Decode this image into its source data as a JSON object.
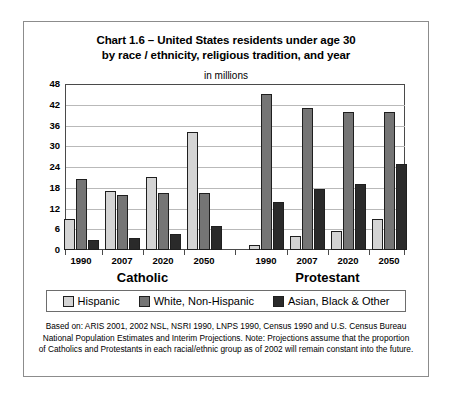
{
  "chart_data": {
    "type": "bar",
    "title": "Chart 1.6 – United States residents under age 30 by race / ethnicity, religious tradition, and year",
    "title_lines": [
      "Chart 1.6 – United States residents under age 30",
      "by race / ethnicity, religious tradition, and year"
    ],
    "subtitle": "in millions",
    "xlabel": "",
    "ylabel": "",
    "ylim": [
      0,
      48
    ],
    "yticks": [
      48,
      42,
      36,
      30,
      24,
      18,
      12,
      6,
      0
    ],
    "grid": true,
    "legend_position": "bottom",
    "groups": [
      "Catholic",
      "Protestant"
    ],
    "categories": [
      "1990",
      "2007",
      "2020",
      "2050",
      "1990",
      "2007",
      "2020",
      "2050"
    ],
    "series": [
      {
        "name": "Hispanic",
        "color": "#d4d4d4",
        "values": [
          9,
          17,
          21,
          34,
          1.5,
          4,
          5.5,
          9
        ]
      },
      {
        "name": "White, Non-Hispanic",
        "color": "#757575",
        "values": [
          20.5,
          16,
          16.5,
          16.5,
          45,
          41,
          40,
          40
        ]
      },
      {
        "name": "Asian, Black & Other",
        "color": "#2a2a2a",
        "values": [
          3,
          3.5,
          4.5,
          7,
          14,
          17.5,
          19,
          25
        ]
      }
    ],
    "footnote_lines": [
      "Based on: ARIS 2001, 2002 NSL, NSRI 1990, LNPS 1990, Census 1990 and U.S. Census Bureau",
      "National Population Estimates and Interim Projections. Note: Projections assume that the proportion",
      "of Catholics and Protestants in each racial/ethnic group as of 2002 will remain constant into the future."
    ]
  }
}
